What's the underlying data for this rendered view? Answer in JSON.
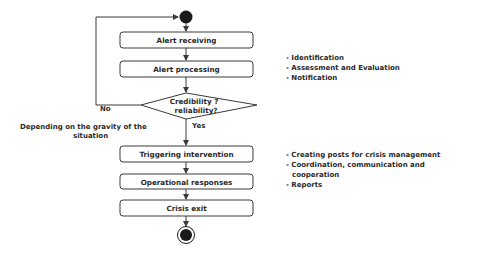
{
  "diagram": {
    "type": "activity-flowchart",
    "colors": {
      "stroke": "#3a3a3a",
      "fill": "#ffffff",
      "node_fill": "#1a1a1a",
      "text": "#2a2a2a"
    },
    "start_node": {
      "shape": "filled-circle"
    },
    "end_node": {
      "shape": "bullseye-circle"
    },
    "activities": [
      {
        "id": "alert-receiving",
        "label": "Alert receiving"
      },
      {
        "id": "alert-processing",
        "label": "Alert processing"
      },
      {
        "id": "triggering-intervention",
        "label": "Triggering intervention"
      },
      {
        "id": "operational-responses",
        "label": "Operational responses"
      },
      {
        "id": "crisis-exit",
        "label": "Crisis exit"
      }
    ],
    "decision": {
      "line1": "Credibility ?",
      "line2": "reliability?",
      "no_label": "No",
      "yes_label": "Yes"
    },
    "side_label": {
      "line1": "Depending on the gravity of the",
      "line2": "situation"
    },
    "notes": {
      "processing": [
        "- Identification",
        "- Assessment and Evaluation",
        "- Notification"
      ],
      "intervention": [
        "- Creating posts for crisis management",
        "- Coordination, communication and",
        "cooperation",
        "- Reports"
      ]
    }
  }
}
